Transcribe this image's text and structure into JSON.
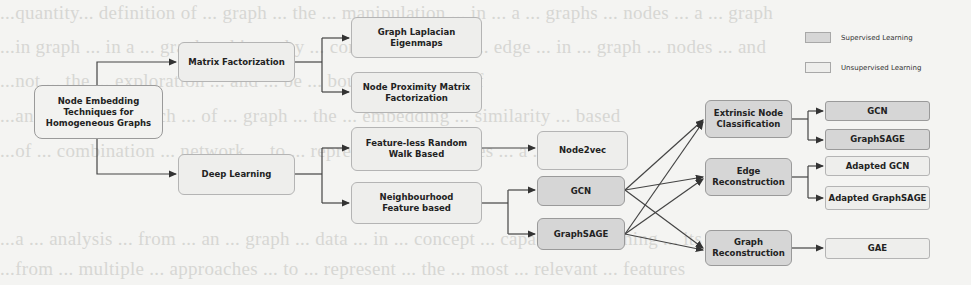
{
  "background_text": [
    "...quantity... definition of ... graph ... the ... manipulation ... in ... a ... graphs ... nodes ... a ... graph",
    "...in graph ... in a ... graph ... hierarchy ... combination ... to ... edge ... in ... graph ... nodes ... and",
    "...not ... the ... exploration ... and ... be ... bound ... same ... of",
    "...analysis ... approach ... of ... graph ... the ... embedding ... similarity ... based",
    "...of ... combination ... network ... to ... representation ... nodes ... a ... graph",
    "...a ... analysis ... from ... an ... graph ... data ... in ... concept ... capacity ... teaching ... its",
    "...from ... multiple ... approaches ... to ... represent ... the ... most ... relevant ... features"
  ],
  "legend": {
    "supervised": {
      "label": "Supervised Learning",
      "color": "#d6d6d6"
    },
    "unsupervised": {
      "label": "Unsupervised Learning",
      "color": "#eeeeec"
    }
  },
  "nodes": {
    "root": "Node Embedding Techniques for Homogeneous Graphs",
    "matrix_factorization": "Matrix Factorization",
    "deep_learning": "Deep Learning",
    "graph_laplacian": "Graph Laplacian Eigenmaps",
    "node_proximity": "Node Proximity Matrix Factorization",
    "feature_less": "Feature-less Random Walk Based",
    "neighbourhood": "Neighbourhood Feature based",
    "node2vec": "Node2vec",
    "gcn_mid": "GCN",
    "graphsage_mid": "GraphSAGE",
    "extrinsic": "Extrinsic Node Classification",
    "edge_reconstruction": "Edge Reconstruction",
    "graph_reconstruction": "Graph Reconstruction",
    "gcn_right": "GCN",
    "graphsage_right": "GraphSAGE",
    "adapted_gcn": "Adapted GCN",
    "adapted_graphsage": "Adapted GraphSAGE",
    "gae": "GAE"
  }
}
